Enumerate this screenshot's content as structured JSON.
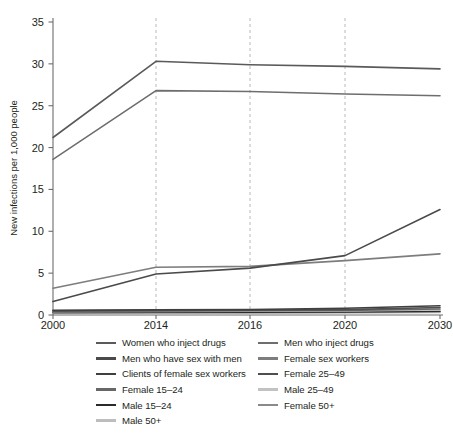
{
  "chart_data": {
    "type": "line",
    "title": "",
    "xlabel": "",
    "ylabel": "New infections per 1,000 people",
    "categories": [
      "2000",
      "2014",
      "2016",
      "2020",
      "2030"
    ],
    "x_tick_labels": [
      "2000",
      "2014",
      "2016",
      "2020",
      "2030"
    ],
    "y_tick_labels": [
      "0",
      "5",
      "10",
      "15",
      "20",
      "25",
      "30",
      "35"
    ],
    "y_ticks": [
      0,
      5,
      10,
      15,
      20,
      25,
      30,
      35
    ],
    "ylim": [
      0,
      35
    ],
    "grid": "vertical-dashed",
    "gridlines_at": [
      "2014",
      "2016",
      "2020"
    ],
    "legend_position": "below",
    "legend_columns": 2,
    "series": [
      {
        "name": "Women who inject drugs",
        "color": "#5a5a5a",
        "values": [
          21.2,
          30.3,
          29.9,
          29.7,
          29.4
        ]
      },
      {
        "name": "Men who inject drugs",
        "color": "#6e6e6e",
        "values": [
          18.6,
          26.8,
          26.7,
          26.4,
          26.2
        ]
      },
      {
        "name": "Men who have sex with men",
        "color": "#4a4a4a",
        "values": [
          1.6,
          4.9,
          5.6,
          7.1,
          12.6
        ]
      },
      {
        "name": "Female sex workers",
        "color": "#7d7d7d",
        "values": [
          3.2,
          5.7,
          5.8,
          6.5,
          7.3
        ]
      },
      {
        "name": "Clients of female sex workers",
        "color": "#3f3f3f",
        "values": [
          0.55,
          0.62,
          0.66,
          0.8,
          1.1
        ]
      },
      {
        "name": "Female 25–49",
        "color": "#4f4f4f",
        "values": [
          0.5,
          0.55,
          0.58,
          0.65,
          0.9
        ]
      },
      {
        "name": "Female 15–24",
        "color": "#676767",
        "values": [
          0.45,
          0.48,
          0.5,
          0.55,
          0.72
        ]
      },
      {
        "name": "Male 25–49",
        "color": "#c2c2c2",
        "values": [
          0.4,
          0.42,
          0.44,
          0.48,
          0.6
        ]
      },
      {
        "name": "Male 15–24",
        "color": "#2b2b2b",
        "values": [
          0.3,
          0.32,
          0.33,
          0.36,
          0.45
        ]
      },
      {
        "name": "Female 50+",
        "color": "#8a8a8a",
        "values": [
          0.26,
          0.28,
          0.3,
          0.33,
          0.4
        ]
      },
      {
        "name": "Male 50+",
        "color": "#bdbdbd",
        "values": [
          0.2,
          0.22,
          0.23,
          0.25,
          0.3
        ]
      }
    ]
  },
  "axis": {
    "y_title": "New infections per 1,000 people"
  },
  "legend": {
    "left_column": [
      {
        "label": "Women who inject drugs",
        "color": "#5a5a5a"
      },
      {
        "label": "Men who have sex with men",
        "color": "#4a4a4a"
      },
      {
        "label": "Clients of female sex workers",
        "color": "#3f3f3f"
      },
      {
        "label": "Female 15–24",
        "color": "#676767"
      },
      {
        "label": "Male 15–24",
        "color": "#2b2b2b"
      },
      {
        "label": "Male 50+",
        "color": "#bdbdbd"
      }
    ],
    "right_column": [
      {
        "label": "Men who inject drugs",
        "color": "#6e6e6e"
      },
      {
        "label": "Female sex workers",
        "color": "#7d7d7d"
      },
      {
        "label": "Female 25–49",
        "color": "#4f4f4f"
      },
      {
        "label": "Male 25–49",
        "color": "#c2c2c2"
      },
      {
        "label": "Female 50+",
        "color": "#8a8a8a"
      }
    ]
  },
  "colors": {
    "axis": "#6d6d6d",
    "gridline": "#b9b9b9",
    "text": "#231f20",
    "background": "#ffffff"
  }
}
